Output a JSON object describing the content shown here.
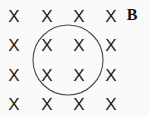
{
  "figure": {
    "name": "magnetic-field-into-page-with-circular-loop",
    "width": 149,
    "height": 117,
    "background_color": "#fafafa"
  },
  "field": {
    "symbol": "X",
    "symbol_meaning": "magnetic-field-into-page",
    "symbol_color": "#1c1c1c",
    "rows": 4,
    "columns": 4,
    "column_centers_px": [
      14,
      47,
      79,
      111
    ],
    "row_centers_px": [
      16,
      45,
      75,
      104
    ],
    "markers": [
      {
        "label": "X",
        "x": 14,
        "y": 16,
        "row": 0,
        "col": 0,
        "inside_loop": false
      },
      {
        "label": "X",
        "x": 47,
        "y": 16,
        "row": 0,
        "col": 1,
        "inside_loop": false
      },
      {
        "label": "X",
        "x": 79,
        "y": 16,
        "row": 0,
        "col": 2,
        "inside_loop": false
      },
      {
        "label": "X",
        "x": 111,
        "y": 16,
        "row": 0,
        "col": 3,
        "inside_loop": false
      },
      {
        "label": "X",
        "x": 14,
        "y": 45,
        "row": 1,
        "col": 0,
        "inside_loop": false
      },
      {
        "label": "X",
        "x": 47,
        "y": 45,
        "row": 1,
        "col": 1,
        "inside_loop": true
      },
      {
        "label": "X",
        "x": 79,
        "y": 45,
        "row": 1,
        "col": 2,
        "inside_loop": true
      },
      {
        "label": "X",
        "x": 111,
        "y": 45,
        "row": 1,
        "col": 3,
        "inside_loop": false
      },
      {
        "label": "X",
        "x": 14,
        "y": 75,
        "row": 2,
        "col": 0,
        "inside_loop": false
      },
      {
        "label": "X",
        "x": 47,
        "y": 75,
        "row": 2,
        "col": 1,
        "inside_loop": true
      },
      {
        "label": "X",
        "x": 79,
        "y": 75,
        "row": 2,
        "col": 2,
        "inside_loop": true
      },
      {
        "label": "X",
        "x": 111,
        "y": 75,
        "row": 2,
        "col": 3,
        "inside_loop": false
      },
      {
        "label": "X",
        "x": 14,
        "y": 104,
        "row": 3,
        "col": 0,
        "inside_loop": false
      },
      {
        "label": "X",
        "x": 47,
        "y": 104,
        "row": 3,
        "col": 1,
        "inside_loop": false
      },
      {
        "label": "X",
        "x": 79,
        "y": 104,
        "row": 3,
        "col": 2,
        "inside_loop": false
      },
      {
        "label": "X",
        "x": 111,
        "y": 104,
        "row": 3,
        "col": 3,
        "inside_loop": false
      }
    ]
  },
  "loop": {
    "shape": "circle",
    "center_x": 68,
    "center_y": 60,
    "radius": 35,
    "stroke_color": "#4a4a4a",
    "stroke_width": 1.1,
    "fill": "none"
  },
  "labels": {
    "field_label": {
      "text": "B",
      "x": 132,
      "y": 15,
      "color": "#131313",
      "style": "bold-serif"
    }
  }
}
